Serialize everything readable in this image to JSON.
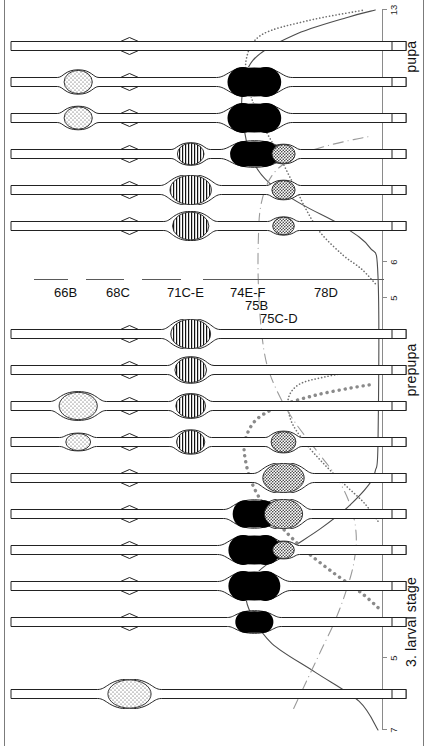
{
  "figure": {
    "title_present": false,
    "orientation": "rotated-90-ccw",
    "background": "#ffffff",
    "ink": "#1a1a1a"
  },
  "axis": {
    "name": "developmental-time-axis",
    "label_segments": [
      {
        "id": "larval",
        "text": "3. larval stage"
      },
      {
        "id": "prepupa",
        "text": "prepupa"
      },
      {
        "id": "pupa",
        "text": "pupa"
      }
    ],
    "ticks": [
      {
        "value": -7,
        "label": "7"
      },
      {
        "value": -6,
        "label": "6"
      },
      {
        "value": -5,
        "label": "5"
      },
      {
        "value": -4,
        "label": "4"
      },
      {
        "value": -3,
        "label": "3"
      },
      {
        "value": -2,
        "label": "2"
      },
      {
        "value": -1,
        "label": "1"
      },
      {
        "value": 0,
        "label": "0"
      },
      {
        "value": 1,
        "label": "1"
      },
      {
        "value": 2,
        "label": "2"
      },
      {
        "value": 3,
        "label": "3"
      },
      {
        "value": 4,
        "label": "4"
      },
      {
        "value": 5,
        "label": "5"
      },
      {
        "value": 6,
        "label": "6"
      },
      {
        "value": 7,
        "label": "7"
      },
      {
        "value": 8,
        "label": "8"
      },
      {
        "value": 9,
        "label": "9"
      },
      {
        "value": 10,
        "label": "10"
      },
      {
        "value": 11,
        "label": "11"
      },
      {
        "value": 12,
        "label": "12"
      },
      {
        "value": 13,
        "label": "13"
      }
    ]
  },
  "loci": [
    {
      "name": "66B",
      "label": "66B",
      "x_frac": 0.17
    },
    {
      "name": "68C",
      "label": "68C",
      "x_frac": 0.3
    },
    {
      "name": "71C-E",
      "label": "71C-E",
      "x_frac": 0.455
    },
    {
      "name": "74E-F",
      "label": "74E-F",
      "x_frac": 0.616
    },
    {
      "name": "75B",
      "label": "75B",
      "x_frac": 0.652
    },
    {
      "name": "75C-D",
      "label": "75C-D",
      "x_frac": 0.69
    },
    {
      "name": "78D",
      "label": "78D",
      "x_frac": 0.828
    }
  ],
  "chromosomes": [
    {
      "time": -6,
      "puffs": [
        {
          "locus": "68C",
          "size": 0.95,
          "fill": "stipple-light",
          "width": 0.052
        }
      ]
    },
    {
      "time": -4,
      "puffs": [
        {
          "locus": "74E-F",
          "size": 0.62,
          "fill": "solid-black",
          "width": 0.044
        }
      ]
    },
    {
      "time": -3,
      "puffs": [
        {
          "locus": "74E-F",
          "size": 1.0,
          "fill": "solid-black",
          "width": 0.06
        }
      ]
    },
    {
      "time": -2,
      "puffs": [
        {
          "locus": "74E-F",
          "size": 1.0,
          "fill": "solid-black",
          "width": 0.06
        },
        {
          "locus": "75C-D",
          "size": 0.4,
          "fill": "stipple-dense",
          "width": 0.026
        }
      ]
    },
    {
      "time": -1,
      "puffs": [
        {
          "locus": "74E-F",
          "size": 0.88,
          "fill": "solid-black",
          "width": 0.05
        },
        {
          "locus": "75C-D",
          "size": 1.0,
          "fill": "stipple-dense",
          "width": 0.046
        }
      ]
    },
    {
      "time": 0,
      "puffs": [
        {
          "locus": "75C-D",
          "size": 1.0,
          "fill": "stipple-dense",
          "width": 0.05
        }
      ]
    },
    {
      "time": 1,
      "puffs": [
        {
          "locus": "66B",
          "size": 0.4,
          "fill": "stipple-light",
          "width": 0.03
        },
        {
          "locus": "71C-E",
          "size": 0.7,
          "fill": "striped",
          "width": 0.034
        },
        {
          "locus": "75C-D",
          "size": 0.58,
          "fill": "stipple-dense",
          "width": 0.03
        }
      ]
    },
    {
      "time": 2,
      "puffs": [
        {
          "locus": "66B",
          "size": 0.9,
          "fill": "stipple-light",
          "width": 0.046
        },
        {
          "locus": "71C-E",
          "size": 0.72,
          "fill": "striped",
          "width": 0.036
        }
      ]
    },
    {
      "time": 3,
      "puffs": [
        {
          "locus": "71C-E",
          "size": 0.8,
          "fill": "striped",
          "width": 0.038
        }
      ]
    },
    {
      "time": 4,
      "puffs": [
        {
          "locus": "71C-E",
          "size": 1.0,
          "fill": "striped",
          "width": 0.048
        }
      ]
    },
    {
      "time": 7,
      "puffs": [
        {
          "locus": "71C-E",
          "size": 0.92,
          "fill": "striped",
          "width": 0.044
        },
        {
          "locus": "75C-D",
          "size": 0.42,
          "fill": "stipple-dense",
          "width": 0.026
        }
      ]
    },
    {
      "time": 8,
      "puffs": [
        {
          "locus": "71C-E",
          "size": 1.0,
          "fill": "striped",
          "width": 0.05
        },
        {
          "locus": "75C-D",
          "size": 0.48,
          "fill": "stipple-dense",
          "width": 0.028
        }
      ]
    },
    {
      "time": 9,
      "puffs": [
        {
          "locus": "71C-E",
          "size": 0.62,
          "fill": "striped",
          "width": 0.032
        },
        {
          "locus": "74E-F",
          "size": 0.8,
          "fill": "solid-black",
          "width": 0.056
        },
        {
          "locus": "75C-D",
          "size": 0.48,
          "fill": "stipple-dense",
          "width": 0.028
        }
      ]
    },
    {
      "time": 10,
      "puffs": [
        {
          "locus": "66B",
          "size": 0.66,
          "fill": "stipple-light",
          "width": 0.034
        },
        {
          "locus": "74E-F",
          "size": 1.0,
          "fill": "solid-black",
          "width": 0.062
        }
      ]
    },
    {
      "time": 11,
      "puffs": [
        {
          "locus": "66B",
          "size": 0.7,
          "fill": "stipple-light",
          "width": 0.034
        },
        {
          "locus": "74E-F",
          "size": 1.0,
          "fill": "solid-black",
          "width": 0.062
        }
      ]
    },
    {
      "time": 12,
      "puffs": []
    }
  ],
  "chart_data": {
    "type": "line",
    "title": "",
    "xlabel": "",
    "ylabel": "",
    "xlim": [
      -7,
      13
    ],
    "ylim": [
      0,
      1
    ],
    "grid": false,
    "legend_position": "none",
    "x_tick_labels": [
      "7",
      "6",
      "5",
      "4",
      "3",
      "2",
      "1",
      "0",
      "1",
      "2",
      "3",
      "4",
      "5",
      "6",
      "7",
      "8",
      "9",
      "10",
      "11",
      "12",
      "13"
    ],
    "stage_bands": [
      "3. larval stage",
      "prepupa",
      "pupa"
    ],
    "series": [
      {
        "name": "solid-curve",
        "style": "solid",
        "color": "#4d4d4d",
        "points": [
          [
            -7.0,
            0.0
          ],
          [
            -6.2,
            0.14
          ],
          [
            -5.4,
            0.46
          ],
          [
            -4.6,
            0.78
          ],
          [
            -3.8,
            0.93
          ],
          [
            -3.2,
            0.97
          ],
          [
            -2.6,
            0.88
          ],
          [
            -2.0,
            0.66
          ],
          [
            -1.4,
            0.42
          ],
          [
            -0.8,
            0.22
          ],
          [
            -0.2,
            0.07
          ],
          [
            0.2,
            0.02
          ],
          [
            1.0,
            0.0
          ],
          [
            5.6,
            0.0
          ],
          [
            6.4,
            0.06
          ],
          [
            7.0,
            0.26
          ],
          [
            7.6,
            0.56
          ],
          [
            8.2,
            0.8
          ],
          [
            8.8,
            0.92
          ],
          [
            9.6,
            0.98
          ],
          [
            10.6,
            1.0
          ],
          [
            11.6,
            0.92
          ],
          [
            12.3,
            0.62
          ],
          [
            12.8,
            0.22
          ],
          [
            13.0,
            0.02
          ]
        ]
      },
      {
        "name": "coarse-dotted-curve",
        "style": "coarse-dotted",
        "color": "#8a8a8a",
        "points": [
          [
            -3.6,
            0.0
          ],
          [
            -3.2,
            0.12
          ],
          [
            -2.6,
            0.34
          ],
          [
            -2.0,
            0.54
          ],
          [
            -1.4,
            0.7
          ],
          [
            -0.8,
            0.83
          ],
          [
            -0.2,
            0.92
          ],
          [
            0.4,
            0.97
          ],
          [
            1.0,
            0.98
          ],
          [
            1.6,
            0.9
          ],
          [
            2.0,
            0.72
          ],
          [
            2.3,
            0.46
          ],
          [
            2.5,
            0.2
          ],
          [
            2.6,
            0.04
          ]
        ]
      },
      {
        "name": "fine-dotted-curve",
        "style": "fine-dotted",
        "color": "#6e6e6e",
        "points": [
          [
            -1.2,
            0.0
          ],
          [
            -0.7,
            0.1
          ],
          [
            -0.2,
            0.24
          ],
          [
            0.4,
            0.4
          ],
          [
            1.0,
            0.54
          ],
          [
            1.6,
            0.64
          ],
          [
            2.2,
            0.66
          ],
          [
            2.6,
            0.58
          ],
          [
            2.8,
            0.4
          ],
          [
            2.95,
            0.18
          ],
          [
            3.0,
            0.03
          ]
        ]
      },
      {
        "name": "fine-dotted-curve-2",
        "style": "fine-dotted",
        "color": "#6e6e6e",
        "points": [
          [
            5.4,
            0.02
          ],
          [
            5.8,
            0.12
          ],
          [
            6.2,
            0.26
          ],
          [
            6.8,
            0.42
          ],
          [
            7.4,
            0.52
          ],
          [
            8.0,
            0.6
          ],
          [
            8.6,
            0.68
          ],
          [
            9.2,
            0.76
          ],
          [
            9.9,
            0.86
          ],
          [
            10.7,
            0.94
          ],
          [
            11.6,
            0.97
          ],
          [
            12.3,
            0.86
          ],
          [
            12.7,
            0.52
          ],
          [
            13.0,
            0.1
          ]
        ]
      },
      {
        "name": "dash-dot-curve",
        "style": "dash-dot",
        "color": "#9a9a9a",
        "points": [
          [
            -6.4,
            0.62
          ],
          [
            -5.6,
            0.52
          ],
          [
            -4.8,
            0.42
          ],
          [
            -4.0,
            0.32
          ],
          [
            -3.2,
            0.24
          ],
          [
            -2.4,
            0.18
          ],
          [
            -1.6,
            0.16
          ],
          [
            -0.8,
            0.2
          ],
          [
            0.0,
            0.3
          ],
          [
            0.8,
            0.46
          ],
          [
            1.6,
            0.62
          ],
          [
            2.4,
            0.74
          ],
          [
            3.2,
            0.82
          ],
          [
            4.2,
            0.86
          ],
          [
            5.4,
            0.88
          ],
          [
            6.6,
            0.88
          ],
          [
            7.6,
            0.86
          ],
          [
            8.4,
            0.78
          ],
          [
            8.9,
            0.62
          ],
          [
            9.2,
            0.4
          ],
          [
            9.4,
            0.18
          ],
          [
            9.5,
            0.04
          ]
        ]
      }
    ]
  }
}
